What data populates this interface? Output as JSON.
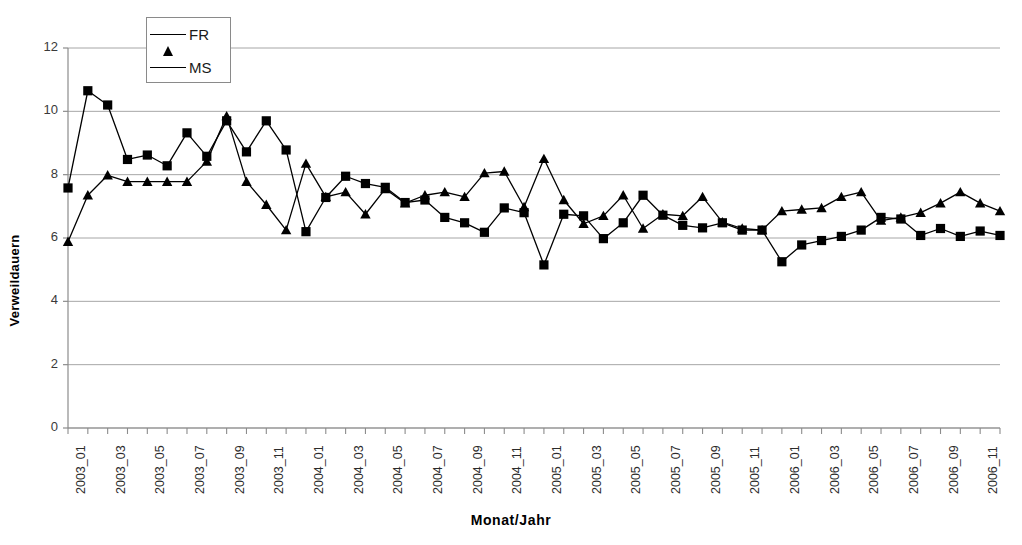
{
  "chart_data": {
    "type": "line",
    "title": "",
    "xlabel": "Monat/Jahr",
    "ylabel": "Verweildauern",
    "ylim": [
      0,
      12
    ],
    "yticks": [
      0,
      2,
      4,
      6,
      8,
      10,
      12
    ],
    "grid": true,
    "legend_position": "top-left",
    "x": [
      "2003_01",
      "2003_02",
      "2003_03",
      "2003_04",
      "2003_05",
      "2003_06",
      "2003_07",
      "2003_08",
      "2003_09",
      "2003_10",
      "2003_11",
      "2003_12",
      "2004_01",
      "2004_02",
      "2004_03",
      "2004_04",
      "2004_05",
      "2004_06",
      "2004_07",
      "2004_08",
      "2004_09",
      "2004_10",
      "2004_11",
      "2004_12",
      "2005_01",
      "2005_02",
      "2005_03",
      "2005_04",
      "2005_05",
      "2005_06",
      "2005_07",
      "2005_08",
      "2005_09",
      "2005_10",
      "2005_11",
      "2005_12",
      "2006_01",
      "2006_02",
      "2006_03",
      "2006_04",
      "2006_05",
      "2006_06",
      "2006_07",
      "2006_08",
      "2006_09",
      "2006_10",
      "2006_11",
      "2006_12"
    ],
    "xtick_labels": [
      "2003_01",
      "",
      "2003_03",
      "",
      "2003_05",
      "",
      "2003_07",
      "",
      "2003_09",
      "",
      "2003_11",
      "",
      "2004_01",
      "",
      "2004_03",
      "",
      "2004_05",
      "",
      "2004_07",
      "",
      "2004_09",
      "",
      "2004_11",
      "",
      "2005_01",
      "",
      "2005_03",
      "",
      "2005_05",
      "",
      "2005_07",
      "",
      "2005_09",
      "",
      "2005_11",
      "",
      "2006_01",
      "",
      "2006_03",
      "",
      "2006_05",
      "",
      "2006_07",
      "",
      "2006_09",
      "",
      "2006_11",
      ""
    ],
    "series": [
      {
        "name": "FR",
        "marker": "triangle",
        "color": "#000000",
        "values": [
          5.88,
          7.35,
          7.98,
          7.78,
          7.78,
          7.78,
          7.78,
          8.42,
          9.85,
          7.78,
          7.05,
          6.25,
          8.35,
          7.3,
          7.45,
          6.75,
          7.55,
          7.1,
          7.35,
          7.45,
          7.3,
          8.05,
          8.1,
          6.98,
          8.5,
          7.2,
          6.45,
          6.7,
          7.35,
          6.3,
          6.75,
          6.7,
          7.3,
          6.5,
          6.3,
          6.25,
          6.85,
          6.9,
          6.95,
          7.3,
          7.45,
          6.55,
          6.65,
          6.8,
          7.1,
          7.45,
          7.1,
          6.85
        ]
      },
      {
        "name": "MS",
        "marker": "square",
        "color": "#000000",
        "values": [
          7.58,
          10.65,
          10.2,
          8.48,
          8.62,
          8.28,
          9.32,
          8.58,
          9.7,
          8.72,
          9.7,
          8.78,
          6.2,
          7.28,
          7.95,
          7.72,
          7.6,
          7.12,
          7.2,
          6.65,
          6.48,
          6.18,
          6.95,
          6.8,
          5.15,
          6.75,
          6.7,
          5.98,
          6.48,
          7.35,
          6.72,
          6.4,
          6.32,
          6.48,
          6.25,
          6.25,
          5.25,
          5.78,
          5.92,
          6.05,
          6.25,
          6.65,
          6.6,
          6.08,
          6.3,
          6.05,
          6.22,
          6.08
        ]
      }
    ]
  }
}
